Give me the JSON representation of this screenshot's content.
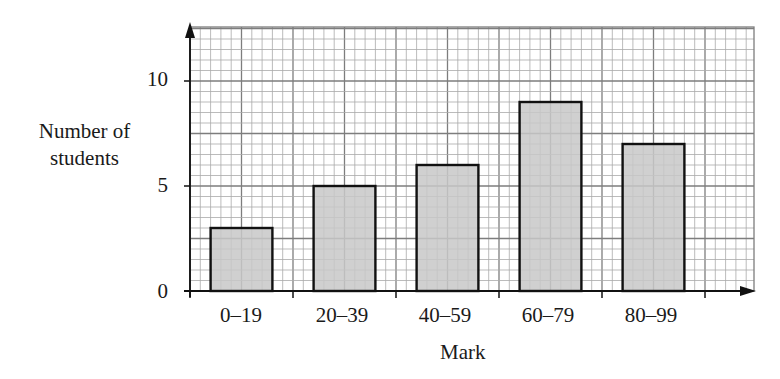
{
  "chart_data": {
    "type": "bar",
    "title": "",
    "xlabel": "Mark",
    "ylabel": "Number of students",
    "categories": [
      "0–19",
      "20–39",
      "40–59",
      "60–79",
      "80–99"
    ],
    "values": [
      3,
      5,
      6,
      9,
      7
    ],
    "ylim": [
      0,
      12.5
    ],
    "yticks": [
      0,
      5,
      10
    ],
    "grid": true,
    "legend": null,
    "colors": {
      "bar_fill": "#c8c8c8",
      "bar_edge": "#111111",
      "grid_minor": "#a9a9a9",
      "grid_major": "#7d7d7d",
      "axis": "#111111"
    }
  },
  "labels": {
    "ylabel_line1": "Number of",
    "ylabel_line2": "students",
    "xlabel": "Mark",
    "ytick_0": "0",
    "ytick_5": "5",
    "ytick_10": "10",
    "xtick_0": "0–19",
    "xtick_1": "20–39",
    "xtick_2": "40–59",
    "xtick_3": "60–79",
    "xtick_4": "80–99"
  }
}
